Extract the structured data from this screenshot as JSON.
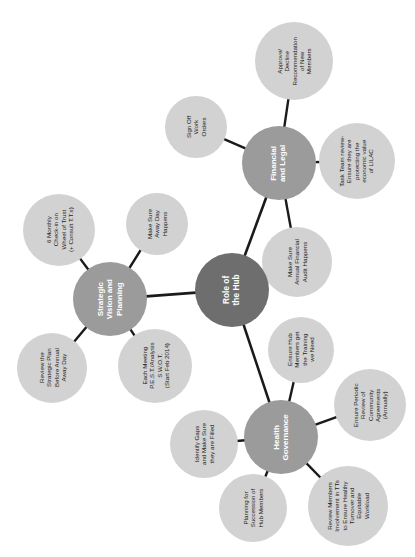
{
  "diagram": {
    "title": "Role of the Hub",
    "type": "mind-map",
    "orientation": "rotated-90-ccw",
    "colors": {
      "center_fill": "#6e6e6e",
      "branch_fill": "#9b9b9b",
      "leaf_fill": "#d2d2d2",
      "edge": "#1a1a1a",
      "background": "#ffffff",
      "center_text": "#ffffff",
      "branch_text": "#ffffff",
      "leaf_text": "#1a1a1a"
    },
    "center": {
      "label": "Role of\nthe Hub",
      "x": 232,
      "y": 290,
      "r": 37
    },
    "branches": [
      {
        "id": "financial-and-legal",
        "label": "Financial\nand Legal",
        "x": 279,
        "y": 163,
        "r": 37,
        "leaves": [
          {
            "id": "approve-decline-recommendation",
            "label": "Approve/\nDecline\nRecommendation\nof New\nMembers",
            "x": 294,
            "y": 61,
            "r": 39
          },
          {
            "id": "sign-off-work-orders",
            "label": "Sign Off\nWork\nOrders",
            "x": 196,
            "y": 127,
            "r": 31
          },
          {
            "id": "task-team-review",
            "label": "Task Team review-\nEnsure they are\nprotecting the\neconomic value\nof LILAC",
            "x": 357,
            "y": 161,
            "r": 38
          },
          {
            "id": "annual-financial-audit",
            "label": "Make Sure\nAnnual Financial\nAudit Happens",
            "x": 297,
            "y": 262,
            "r": 35
          }
        ]
      },
      {
        "id": "strategic-vision-and-planning",
        "label": "Strategic\nVision and\nPlanning",
        "x": 110,
        "y": 299,
        "r": 37,
        "leaves": [
          {
            "id": "six-monthly-check-in",
            "label": "6 Monthly\nCheck-in on\nWheel of Trust\n(+ Consult T.T.s)",
            "x": 59,
            "y": 230,
            "r": 36
          },
          {
            "id": "make-sure-away-day-happens",
            "label": "Make Sure\nAway Day\nHappens",
            "x": 157,
            "y": 224,
            "r": 31
          },
          {
            "id": "review-strategic-plan",
            "label": "Review the\nStrategic Plan\nBefore Annual\nAway Day",
            "x": 52,
            "y": 368,
            "r": 35
          },
          {
            "id": "each-meeting-pest-swot",
            "label": "Each Meeting\nP.E.S.T./Analysis\nS.W.O.T.\n(Start Feb 2014)",
            "x": 155,
            "y": 366,
            "r": 37
          }
        ]
      },
      {
        "id": "health-governance",
        "label": "Health\nGovernance",
        "x": 281,
        "y": 437,
        "r": 37,
        "leaves": [
          {
            "id": "ensure-hub-training",
            "label": "Ensure Hub\nMembers get\nthe Training\nwe Need",
            "x": 301,
            "y": 350,
            "r": 33
          },
          {
            "id": "identify-gaps",
            "label": "Identify Gaps\nand Make Sure\nthey are Filled",
            "x": 204,
            "y": 444,
            "r": 34
          },
          {
            "id": "periodic-review-agreements",
            "label": "Ensure Periodic\nReview of\nCommunity\nAgreements\n(Annually)",
            "x": 370,
            "y": 405,
            "r": 36
          },
          {
            "id": "review-members-involvement",
            "label": "Review Members\nInvolvement in TTs\nto Ensure Healthy\nTurnover and\nEquitable\nWorkload",
            "x": 348,
            "y": 506,
            "r": 40
          },
          {
            "id": "planning-for-succession",
            "label": "Planning for\nSuccession of\nHub Members",
            "x": 253,
            "y": 508,
            "r": 34
          }
        ]
      }
    ]
  }
}
